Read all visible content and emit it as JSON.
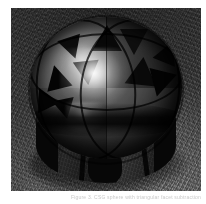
{
  "page": {
    "background_color": "#ffffff",
    "width": 206,
    "height": 204
  },
  "figure": {
    "name": "raytraced-faceted-sphere",
    "alt_description": "Grayscale ray-traced rendering of a reflective faceted sphere with triangular cutouts resting on a bumpy textured ground plane",
    "palette": {
      "background_plate": "#3f3f3f",
      "sphere_highlight": "#ffffff",
      "sphere_midtone": "#6a6a6a",
      "sphere_shadow": "#0b0b0b",
      "cutout_void": "#070707",
      "ground_light": "#8a8a8a",
      "ground_dark": "#2a2a2a",
      "border": "#ffffff"
    },
    "geometry": {
      "subject": "sphere",
      "surface": "specular reflective",
      "cutouts": "triangular facets",
      "ground": "bump-mapped plane",
      "light": "single key light upper-left"
    }
  },
  "caption": {
    "text": "Figure 3.  CSG sphere with triangular facet subtraction"
  }
}
